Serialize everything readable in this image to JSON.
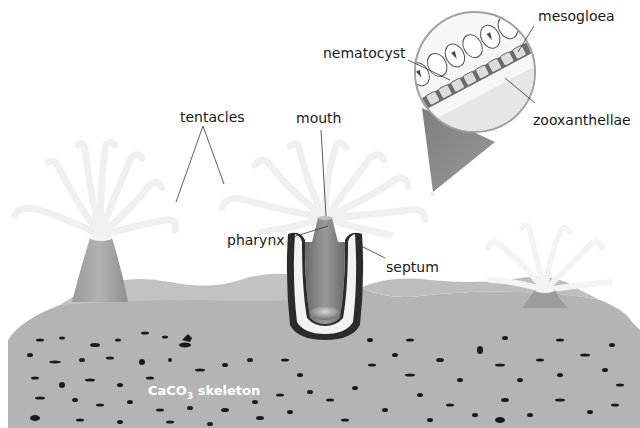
{
  "diagram": {
    "colors": {
      "background": "#ffffff",
      "skeleton": "#b4b4b4",
      "skeleton_dark_spots": "#1a1a1a",
      "polyp_body": "#a8a8a8",
      "tentacles": "#f2f2f2",
      "callout_cone": "#8f8f8f",
      "mesogloea_band": "#6e6e6e",
      "label_text": "#1a1a1a",
      "leader_line": "#333333"
    },
    "labels": {
      "tentacles": "tentacles",
      "mouth": "mouth",
      "pharynx": "pharynx",
      "septum": "septum",
      "nematocyst": "nematocyst",
      "mesogloea": "mesogloea",
      "zooxanthellae": "zooxanthellae",
      "skeleton_prefix": "CaCO",
      "skeleton_subscript": "3",
      "skeleton_suffix": " skeleton"
    },
    "structures": [
      {
        "name": "left-polyp",
        "type": "polyp"
      },
      {
        "name": "center-polyp",
        "type": "cross-section polyp"
      },
      {
        "name": "right-polyp",
        "type": "polyp"
      },
      {
        "name": "magnified-callout",
        "type": "circle inset"
      },
      {
        "name": "skeleton",
        "type": "CaCO3 base"
      }
    ]
  }
}
